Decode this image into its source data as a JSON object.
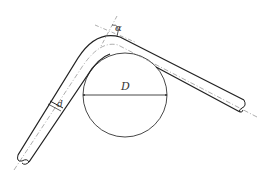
{
  "diagram": {
    "labels": {
      "angle": "α",
      "diameter_former": "D",
      "diameter_pipe": "d"
    },
    "colors": {
      "stroke": "#333333",
      "centerline": "#777777",
      "background": "#ffffff"
    }
  }
}
